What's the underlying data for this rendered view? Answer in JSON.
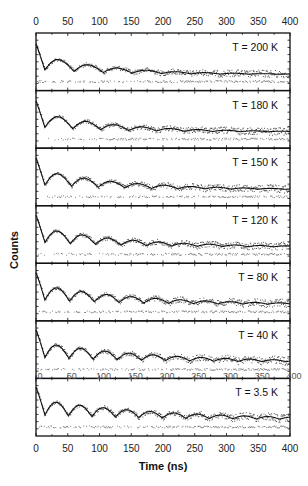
{
  "chart_data": {
    "type": "scatter",
    "title": "",
    "xlabel": "Time (ns)",
    "ylabel": "Counts",
    "xlim": [
      0,
      400
    ],
    "x_ticks": [
      0,
      50,
      100,
      150,
      200,
      250,
      300,
      350,
      400
    ],
    "x_tick_labels": [
      "0",
      "50",
      "100",
      "150",
      "200",
      "250",
      "300",
      "350",
      "400"
    ],
    "top_axis_tick_labels": [
      "0",
      "50",
      "100",
      "150",
      "200",
      "250",
      "300",
      "350",
      "400"
    ],
    "grid": false,
    "legend": null,
    "layout": "7 vertically stacked panels sharing x-axis; ticks on top and bottom",
    "series_description": "Time-differential counts (dots) with fitted decaying oscillation (solid line) per temperature",
    "panels": [
      {
        "label": "T = 200 K",
        "temperature_K": 200,
        "oscillation_period_ns": 46,
        "decay_ns": 110,
        "fit_line": true
      },
      {
        "label": "T = 180 K",
        "temperature_K": 180,
        "oscillation_period_ns": 44,
        "decay_ns": 120,
        "fit_line": true
      },
      {
        "label": "T = 150 K",
        "temperature_K": 150,
        "oscillation_period_ns": 42,
        "decay_ns": 130,
        "fit_line": true
      },
      {
        "label": "T = 120 K",
        "temperature_K": 120,
        "oscillation_period_ns": 40,
        "decay_ns": 140,
        "fit_line": true
      },
      {
        "label": "T = 80 K",
        "temperature_K": 80,
        "oscillation_period_ns": 39,
        "decay_ns": 160,
        "fit_line": true
      },
      {
        "label": "T = 40 K",
        "temperature_K": 40,
        "oscillation_period_ns": 38,
        "decay_ns": 180,
        "fit_line": true
      },
      {
        "label": "T = 3.5 K",
        "temperature_K": 3.5,
        "oscillation_period_ns": 37,
        "decay_ns": 200,
        "fit_line": true
      }
    ],
    "annotations": [
      "Overlaid faint duplicate x tick labels (0–400) along top of T = 3.5 K panel"
    ]
  },
  "colors": {
    "frame": "#111111",
    "data_points": "#333333",
    "fit_line": "#111111",
    "background": "#ffffff"
  }
}
